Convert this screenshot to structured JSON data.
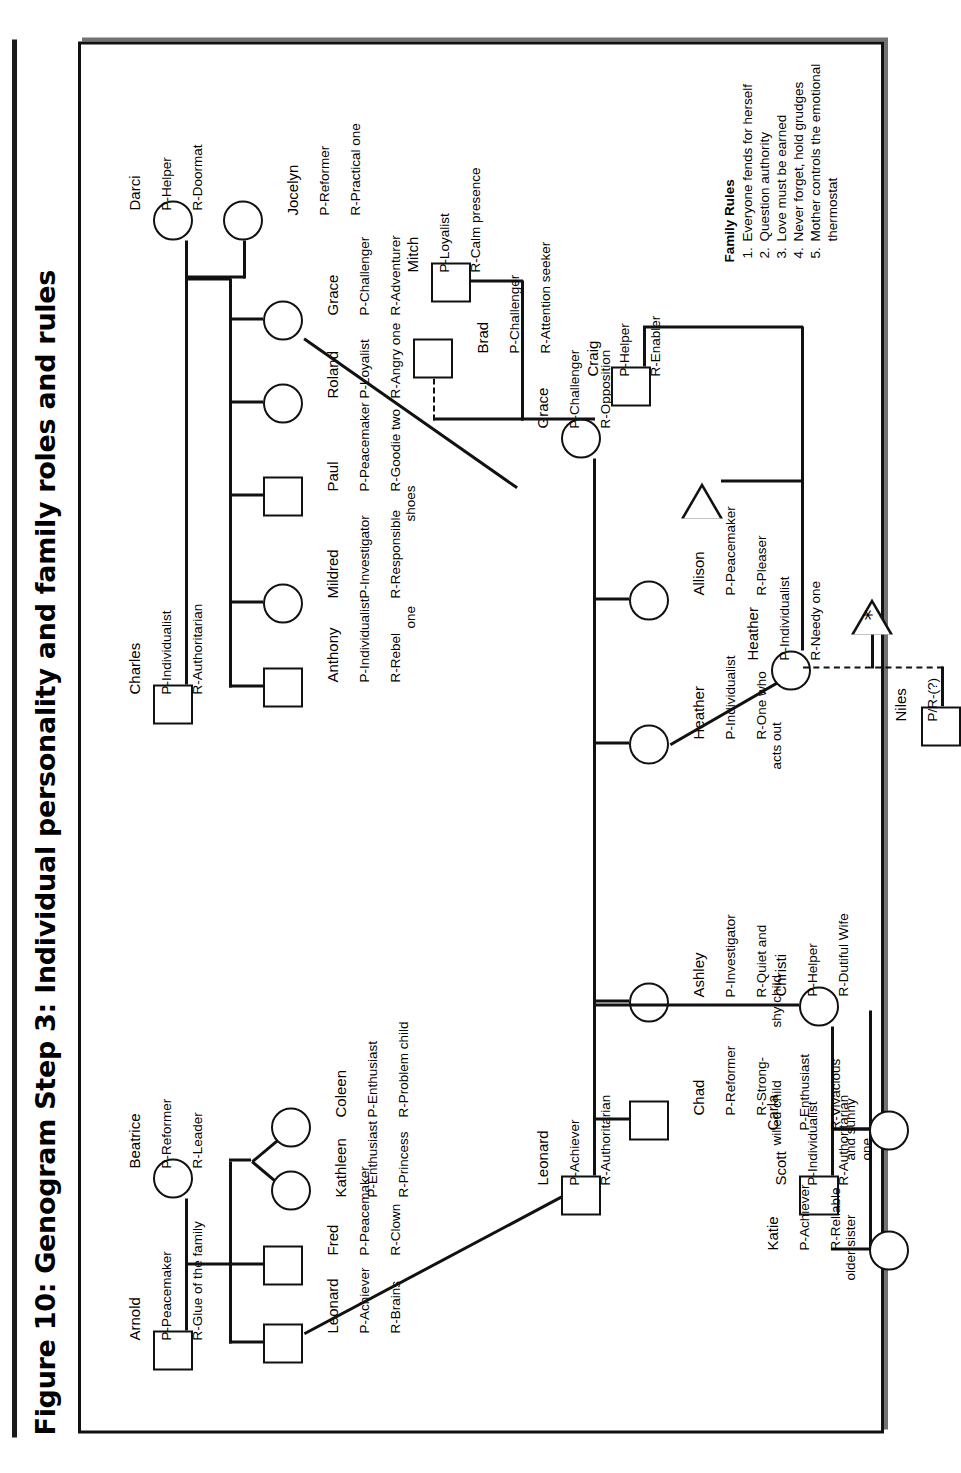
{
  "figure": {
    "title": "Figure 10: Genogram Step 3: Individual personality and family roles and rules"
  },
  "family_rules": {
    "heading": "Family Rules",
    "items": [
      "Everyone fends for herself",
      "Question authority",
      "Love must be earned",
      "Never forget, hold grudges",
      "Mother controls the emotional thermostat"
    ]
  },
  "people": {
    "arnold": {
      "name": "Arnold",
      "personality": "P-Peacemaker",
      "role": "R-Glue of the family"
    },
    "beatrice": {
      "name": "Beatrice",
      "personality": "P-Reformer",
      "role": "R-Leader"
    },
    "charles": {
      "name": "Charles",
      "personality": "P-Individualist",
      "role": "R-Authoritarian"
    },
    "darci": {
      "name": "Darci",
      "personality": "P-Helper",
      "role": "R-Doormat"
    },
    "leonard_g2": {
      "name": "Leonard",
      "personality": "P-Achiever",
      "role": "R-Brains"
    },
    "fred": {
      "name": "Fred",
      "personality": "P-Peacemaker",
      "role": "R-Clown"
    },
    "coleen": {
      "name": "Coleen",
      "personality": "P-Enthusiast",
      "role": "R-Problem child"
    },
    "kathleen": {
      "name": "Kathleen",
      "personality": "P-Enthusiast",
      "role": "R-Princess"
    },
    "anthony": {
      "name": "Anthony",
      "personality": "P-Individualist",
      "role": "R-Rebel"
    },
    "mildred": {
      "name": "Mildred",
      "personality": "P-Investigator",
      "role": "R-Responsible\none"
    },
    "paul": {
      "name": "Paul",
      "personality": "P-Peacemaker",
      "role": "R-Goodie two\nshoes"
    },
    "roland": {
      "name": "Roland",
      "personality": "P-Loyalist",
      "role": "R-Angry one"
    },
    "grace_g2": {
      "name": "Grace",
      "personality": "P-Challenger",
      "role": "R-Adventurer"
    },
    "jocelyn": {
      "name": "Jocelyn",
      "personality": "P-Reformer",
      "role": "R-Practical one"
    },
    "leonard_g3": {
      "name": "Leonard",
      "personality": "P-Achiever",
      "role": "R-Authoritarian"
    },
    "grace_g3": {
      "name": "Grace",
      "personality": "P-Challenger",
      "role": "R-Opposition"
    },
    "mitch": {
      "name": "Mitch",
      "personality": "P-Loyalist",
      "role": "R-Calm presence"
    },
    "brad": {
      "name": "Brad",
      "personality": "P-Challenger",
      "role": "R-Attention seeker"
    },
    "scott": {
      "name": "Scott",
      "personality": "P-Individualist",
      "role": "R-Authoritarian"
    },
    "christi": {
      "name": "Christi",
      "personality": "P-Helper",
      "role": "R-Dutiful Wife"
    },
    "katie": {
      "name": "Katie",
      "personality": "P-Achiever",
      "role": "R-Reliable\nolder sister"
    },
    "carla": {
      "name": "Carla",
      "personality": "P-Enthusiast",
      "role": "R-Vivacious\nand sunny\none"
    },
    "ashley": {
      "name": "Ashley",
      "personality": "P-Investigator",
      "role": "R-Quiet and\nshy child"
    },
    "chad": {
      "name": "Chad",
      "personality": "P-Reformer",
      "role": "R-Strong-\nwilled child"
    },
    "heather_g3": {
      "name": "Heather",
      "personality": "P-Individualist",
      "role": "R-One who\nacts out"
    },
    "allison": {
      "name": "Allison",
      "personality": "P-Peacemaker",
      "role": "R-Pleaser"
    },
    "heather_g4": {
      "name": "Heather",
      "personality": "P-Individualist",
      "role": "R-Needy one"
    },
    "craig": {
      "name": "Craig",
      "personality": "P-Helper",
      "role": "R-Enabler"
    },
    "niles": {
      "name": "Niles",
      "personality": "P/R-(?)",
      "role": ""
    }
  },
  "symbols": {
    "pregnancy_marker": "*"
  }
}
